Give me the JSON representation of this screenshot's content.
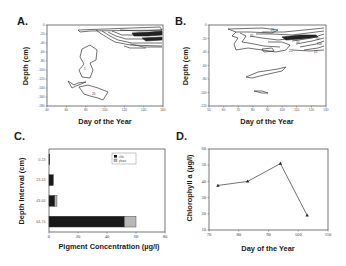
{
  "figure": {
    "panels": [
      "A.",
      "B.",
      "C.",
      "D."
    ]
  },
  "chart_data": [
    {
      "panel": "A.",
      "type": "heatmap",
      "subtype": "contour",
      "title": "",
      "xlabel": "Day of the Year",
      "ylabel": "Depth (cm)",
      "xlim": [
        40,
        160
      ],
      "ylim": [
        -180,
        0
      ],
      "xticks": [
        40,
        60,
        80,
        100,
        120,
        140,
        160
      ],
      "yticks": [
        0,
        -20,
        -40,
        -60,
        -80,
        -100,
        -120,
        -140,
        -160,
        -180
      ],
      "contour_labels": [
        "5",
        "20"
      ],
      "grid": false
    },
    {
      "panel": "B.",
      "type": "heatmap",
      "subtype": "contour",
      "title": "",
      "xlabel": "Day of the Year",
      "ylabel": "Depth (cm)",
      "xlim": [
        50,
        130
      ],
      "ylim": [
        -120,
        0
      ],
      "xticks": [
        50,
        60,
        70,
        80,
        90,
        100,
        110,
        120,
        130
      ],
      "yticks": [
        0,
        -20,
        -40,
        -60,
        -80,
        -100,
        -120
      ],
      "contour_labels": [
        "25",
        "25",
        "25",
        "50",
        "50",
        "100",
        "25"
      ],
      "grid": false
    },
    {
      "panel": "C.",
      "type": "bar",
      "orientation": "horizontal",
      "stacked": true,
      "title": "",
      "xlabel": "Pigment Concentration (µg/l)",
      "ylabel": "Depth Interval (cm)",
      "categories": [
        "0-23",
        "23-43",
        "43-64",
        "64-74"
      ],
      "series": [
        {
          "name": "chla",
          "values": [
            0.5,
            3,
            4,
            52
          ],
          "color": "#1a1a1a"
        },
        {
          "name": "phaeo",
          "values": [
            0,
            0,
            1.5,
            8
          ],
          "color": "#b8b8b8"
        }
      ],
      "xlim": [
        0,
        80
      ],
      "xticks": [
        0,
        20,
        40,
        60,
        80
      ],
      "legend_position": "upper right",
      "grid": false
    },
    {
      "panel": "D.",
      "type": "line",
      "title": "",
      "xlabel": "Day of the Year",
      "ylabel": "Chlorophyll a (µg/l)",
      "x": [
        73,
        83,
        94,
        103
      ],
      "series": [
        {
          "name": "Chlorophyll a",
          "values": [
            37.5,
            40,
            51,
            19
          ],
          "marker": "triangle"
        }
      ],
      "xlim": [
        70,
        110
      ],
      "ylim": [
        10,
        60
      ],
      "xticks": [
        70,
        80,
        90,
        100,
        110
      ],
      "yticks": [
        10,
        20,
        30,
        40,
        50,
        60
      ],
      "grid": false
    }
  ]
}
